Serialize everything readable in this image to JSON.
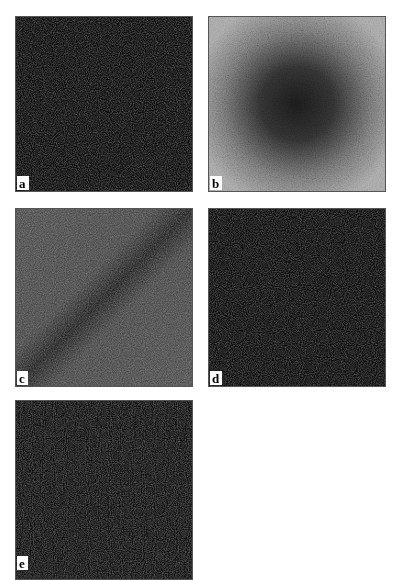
{
  "figure": {
    "panels": [
      {
        "id": "a",
        "label": "a",
        "description": "uniform dark noise texture",
        "base_color": "#2b2b2b"
      },
      {
        "id": "b",
        "label": "b",
        "description": "noise texture with dark circular center fading to light gray edges",
        "center_color": "#1e1e1e",
        "edge_color": "#a8a8a8"
      },
      {
        "id": "c",
        "label": "c",
        "description": "medium gray noise with dark diagonal band from bottom-left to top-right",
        "base_color": "#4a4a4a",
        "band_color": "#202020"
      },
      {
        "id": "d",
        "label": "d",
        "description": "uniform dark noise texture",
        "base_color": "#2a2a2a"
      },
      {
        "id": "e",
        "label": "e",
        "description": "uniform dark noise texture (cropped at bottom)",
        "base_color": "#2e2e2e"
      }
    ]
  }
}
